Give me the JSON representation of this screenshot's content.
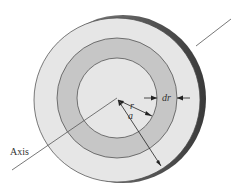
{
  "diagram": {
    "labels": {
      "axis": "Axis",
      "r": "r",
      "a": "a",
      "dr": "dr"
    },
    "colors": {
      "disk_face": "#e6e6e6",
      "ring": "#c4c4c4",
      "edge": "#6a6a6a",
      "stroke": "#444444"
    }
  }
}
